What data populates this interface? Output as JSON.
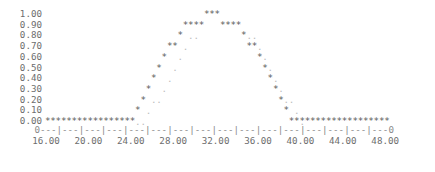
{
  "chart_data": {
    "type": "scatter",
    "render_style": "ascii-text-plot",
    "title": "",
    "xlabel": "",
    "ylabel": "",
    "xlim": [
      16.0,
      48.0
    ],
    "ylim": [
      0.0,
      1.0
    ],
    "grid": false,
    "legend_position": "none",
    "y_tick_labels": [
      "1.00",
      "0.90",
      "0.80",
      "0.70",
      "0.60",
      "0.50",
      "0.40",
      "0.30",
      "0.20",
      "0.10",
      "0.00"
    ],
    "y_tick_values": [
      1.0,
      0.9,
      0.8,
      0.7,
      0.6,
      0.5,
      0.4,
      0.3,
      0.2,
      0.1,
      0.0
    ],
    "x_tick_labels": [
      "16.00",
      "20.00",
      "24.00",
      "28.00",
      "32.00",
      "36.00",
      "40.00",
      "44.00",
      "48.00"
    ],
    "x_tick_values": [
      16,
      20,
      24,
      28,
      32,
      36,
      40,
      44,
      48
    ],
    "axis_line_text": "0---|---|---|---|---|---|---|---|---|---|---|---|---|---|---|---0",
    "axis_marker_start": "0",
    "axis_marker_end": "0",
    "series": [
      {
        "name": "primary",
        "marker": "*",
        "color": "#5a5a5a",
        "x": [
          16.0,
          16.5,
          17.0,
          17.5,
          18.0,
          18.5,
          19.0,
          19.5,
          20.0,
          20.5,
          21.0,
          21.5,
          22.0,
          22.5,
          23.0,
          23.5,
          24.0,
          24.5,
          25.0,
          25.5,
          26.0,
          26.5,
          27.0,
          27.5,
          28.0,
          28.5,
          29.0,
          29.5,
          30.0,
          30.5,
          31.0,
          31.5,
          32.0,
          32.5,
          33.0,
          33.5,
          34.0,
          34.5,
          35.0,
          35.5,
          36.0,
          36.5,
          37.0,
          37.5,
          38.0,
          38.5,
          39.0,
          39.5,
          40.0,
          40.5,
          41.0,
          41.5,
          42.0,
          42.5,
          43.0,
          43.5,
          44.0,
          44.5,
          45.0,
          45.5,
          46.0,
          46.5,
          47.0,
          47.5,
          48.0
        ],
        "y": [
          0.0,
          0.0,
          0.0,
          0.0,
          0.0,
          0.0,
          0.0,
          0.0,
          0.0,
          0.0,
          0.0,
          0.0,
          0.0,
          0.0,
          0.0,
          0.0,
          0.0,
          0.1,
          0.2,
          0.3,
          0.4,
          0.5,
          0.6,
          0.7,
          0.7,
          0.8,
          0.9,
          0.9,
          0.9,
          0.9,
          1.0,
          1.0,
          1.0,
          0.9,
          0.9,
          0.9,
          0.9,
          0.8,
          0.7,
          0.7,
          0.6,
          0.5,
          0.4,
          0.3,
          0.2,
          0.1,
          0.0,
          0.0,
          0.0,
          0.0,
          0.0,
          0.0,
          0.0,
          0.0,
          0.0,
          0.0,
          0.0,
          0.0,
          0.0,
          0.0,
          0.0,
          0.0,
          0.0,
          0.0,
          0.0
        ]
      },
      {
        "name": "secondary",
        "marker": ".",
        "color": "#bcbcbc",
        "x": [
          24.5,
          25.0,
          25.5,
          26.0,
          26.5,
          27.0,
          27.5,
          28.0,
          28.5,
          29.0,
          29.5,
          30.0,
          35.0,
          35.5,
          36.0,
          36.5,
          37.0,
          37.5,
          38.0,
          38.5,
          39.0,
          39.5,
          40.0
        ],
        "y": [
          0.0,
          0.0,
          0.1,
          0.2,
          0.2,
          0.3,
          0.4,
          0.5,
          0.6,
          0.7,
          0.8,
          0.8,
          0.8,
          0.8,
          0.7,
          0.6,
          0.5,
          0.4,
          0.3,
          0.2,
          0.2,
          0.1,
          0.0
        ]
      }
    ]
  }
}
